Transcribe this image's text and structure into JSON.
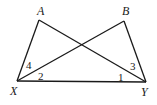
{
  "diagram": {
    "type": "geometry",
    "stroke_color": "#1a1a1a",
    "background": "#ffffff",
    "points": {
      "A": {
        "label": "A",
        "x": 39,
        "y": 20,
        "lx": 42,
        "ly": 15
      },
      "B": {
        "label": "B",
        "x": 124,
        "y": 21,
        "lx": 127,
        "ly": 15
      },
      "X": {
        "label": "X",
        "x": 17,
        "y": 81,
        "lx": 14,
        "ly": 93
      },
      "Y": {
        "label": "Y",
        "x": 146,
        "y": 82,
        "lx": 146,
        "ly": 94
      }
    },
    "segments": [
      [
        "A",
        "X"
      ],
      [
        "A",
        "Y"
      ],
      [
        "B",
        "X"
      ],
      [
        "B",
        "Y"
      ],
      [
        "X",
        "Y"
      ]
    ],
    "angles": [
      {
        "label": "4",
        "x": 30,
        "y": 68
      },
      {
        "label": "2",
        "x": 41,
        "y": 79
      },
      {
        "label": "1",
        "x": 120,
        "y": 80
      },
      {
        "label": "3",
        "x": 133,
        "y": 70
      }
    ]
  }
}
